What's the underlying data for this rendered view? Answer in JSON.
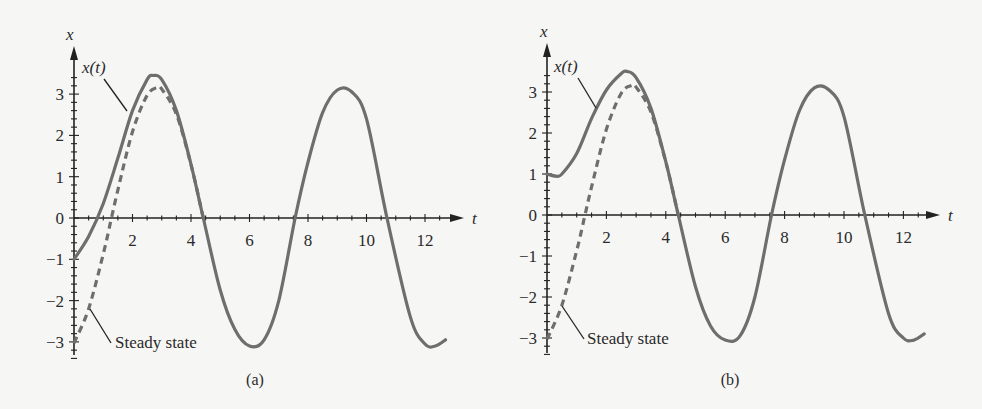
{
  "chart_data": [
    {
      "type": "line",
      "panel": "a",
      "caption": "(a)",
      "xlabel": "t",
      "ylabel": "x",
      "xlim": [
        0,
        13
      ],
      "ylim": [
        -3.3,
        3.9
      ],
      "xticks": [
        2,
        4,
        6,
        8,
        10,
        12
      ],
      "xtick_labels": [
        "2",
        "4",
        "6",
        "8",
        "10",
        "12"
      ],
      "yticks": [
        -3,
        -2,
        -1,
        0,
        1,
        2,
        3
      ],
      "ytick_labels": [
        "−3",
        "−2",
        "−1",
        "0",
        "1",
        "2",
        "3"
      ],
      "grid": false,
      "annotations": [
        {
          "text": "x(t)",
          "points_to": "solid curve near t=1.7, x=2.4"
        },
        {
          "text": "Steady state",
          "points_to": "dashed curve near t=0.7, x=-2.1"
        }
      ],
      "series": [
        {
          "name": "x(t)",
          "style": "solid",
          "x0": -1,
          "t": [
            0,
            0.5,
            1.0,
            1.5,
            2.0,
            2.5,
            2.7,
            3.0,
            3.5,
            4.0,
            4.42,
            5.0,
            5.5,
            6.0,
            6.5,
            7.0,
            7.56,
            8.0,
            8.5,
            9.0,
            9.5,
            10.0,
            10.7,
            11.5,
            12.0,
            12.35,
            12.7
          ],
          "values": [
            -1.0,
            -0.45,
            0.35,
            1.45,
            2.6,
            3.35,
            3.45,
            3.35,
            2.6,
            1.3,
            0.0,
            -1.75,
            -2.7,
            -3.1,
            -2.95,
            -2.0,
            0.0,
            1.35,
            2.55,
            3.1,
            3.05,
            2.4,
            0.0,
            -2.4,
            -3.05,
            -3.1,
            -2.95
          ]
        },
        {
          "name": "Steady state",
          "style": "dashed",
          "t": [
            0,
            0.5,
            1.0,
            1.28,
            1.5,
            2.0,
            2.5,
            2.85,
            3.0,
            3.5,
            4.0,
            4.42
          ],
          "values": [
            -3.03,
            -2.2,
            -0.87,
            0.0,
            0.68,
            2.09,
            2.97,
            3.16,
            3.12,
            2.51,
            1.29,
            0.0
          ]
        }
      ]
    },
    {
      "type": "line",
      "panel": "b",
      "caption": "(b)",
      "xlabel": "t",
      "ylabel": "x",
      "xlim": [
        0,
        13
      ],
      "ylim": [
        -3.3,
        3.9
      ],
      "xticks": [
        2,
        4,
        6,
        8,
        10,
        12
      ],
      "xtick_labels": [
        "2",
        "4",
        "6",
        "8",
        "10",
        "12"
      ],
      "yticks": [
        -3,
        -2,
        -1,
        0,
        1,
        2,
        3
      ],
      "ytick_labels": [
        "−3",
        "−2",
        "−1",
        "0",
        "1",
        "2",
        "3"
      ],
      "grid": false,
      "annotations": [
        {
          "text": "x(t)",
          "points_to": "solid curve near t=1.5, x=2.3"
        },
        {
          "text": "Steady state",
          "points_to": "dashed curve near t=0.6, x=-2.1"
        }
      ],
      "series": [
        {
          "name": "x(t)",
          "style": "solid",
          "x0": 1,
          "t": [
            0,
            0.3,
            0.5,
            1.0,
            1.5,
            2.0,
            2.5,
            2.7,
            3.0,
            3.5,
            4.0,
            4.42,
            5.0,
            5.5,
            6.0,
            6.5,
            7.0,
            7.56,
            8.0,
            8.5,
            9.0,
            9.5,
            10.0,
            10.7,
            11.5,
            12.0,
            12.35,
            12.7
          ],
          "values": [
            1.0,
            0.95,
            1.0,
            1.5,
            2.35,
            3.05,
            3.45,
            3.5,
            3.35,
            2.6,
            1.3,
            0.0,
            -1.75,
            -2.7,
            -3.05,
            -2.95,
            -2.0,
            0.0,
            1.35,
            2.55,
            3.1,
            3.05,
            2.4,
            0.0,
            -2.4,
            -3.0,
            -3.05,
            -2.9
          ]
        },
        {
          "name": "Steady state",
          "style": "dashed",
          "t": [
            0,
            0.5,
            1.0,
            1.28,
            1.5,
            2.0,
            2.5,
            2.85,
            3.0,
            3.5,
            4.0,
            4.42
          ],
          "values": [
            -3.03,
            -2.2,
            -0.87,
            0.0,
            0.68,
            2.09,
            2.97,
            3.16,
            3.12,
            2.51,
            1.29,
            0.0
          ]
        }
      ]
    }
  ],
  "panels": [
    {
      "id": "a",
      "caption": "(a)",
      "axis_x_name": "t",
      "axis_y_name": "x",
      "label_xt": "x(t)",
      "label_ss": "Steady state"
    },
    {
      "id": "b",
      "caption": "(b)",
      "axis_x_name": "t",
      "axis_y_name": "x",
      "label_xt": "x(t)",
      "label_ss": "Steady state"
    }
  ],
  "colors": {
    "curve": "#6e6e6e",
    "axis": "#222222",
    "text": "#2a2a2a",
    "background": "#f6f6f5"
  }
}
